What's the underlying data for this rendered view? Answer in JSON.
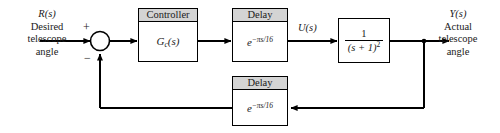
{
  "diagram": {
    "type": "control-system-block-diagram",
    "background_color": "#ffffff",
    "line_color": "#000000",
    "header_fill_color": "#d4d4d4"
  },
  "input": {
    "symbol": "R(s)",
    "line1": "Desired",
    "line2": "telescope",
    "line3": "angle"
  },
  "output": {
    "symbol": "Y(s)",
    "line1": "Actual",
    "line2": "telescope",
    "line3": "angle"
  },
  "summing_junction": {
    "name": "summing-junction",
    "plus_sign": "+",
    "minus_sign": "−"
  },
  "blocks": {
    "controller": {
      "header": "Controller",
      "body_base": "G",
      "body_sub": "c",
      "body_tail": "(s)"
    },
    "forward_delay": {
      "header": "Delay",
      "body_base": "e",
      "body_exponent": "−πs/16"
    },
    "plant": {
      "numerator": "1",
      "denominator_base": "(s + 1)",
      "denominator_exponent": "2"
    },
    "feedback_delay": {
      "header": "Delay",
      "body_base": "e",
      "body_exponent": "−πs/16"
    }
  },
  "signals": {
    "control_signal": "U(s)"
  }
}
